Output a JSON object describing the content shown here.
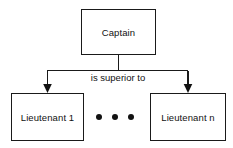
{
  "diagram": {
    "type": "hierarchy-tree",
    "canvas": {
      "width": 233,
      "height": 148,
      "background": "#ffffff"
    },
    "line_color": "#1a1a1a",
    "text_color": "#111111",
    "nodes": [
      {
        "id": "captain",
        "label": "Captain",
        "role": "root"
      },
      {
        "id": "lieutenant_1",
        "label": "Lieutenant 1",
        "role": "child"
      },
      {
        "id": "lieutenant_n",
        "label": "Lieutenant n",
        "role": "child"
      }
    ],
    "edges": [
      {
        "from": "captain",
        "to": "lieutenant_1",
        "label": "is superior to",
        "arrow": "filled-triangle"
      },
      {
        "from": "captain",
        "to": "lieutenant_n",
        "label": "is superior to",
        "arrow": "filled-triangle"
      }
    ],
    "edge_label": "is superior to",
    "ellipsis": {
      "glyph": "•••",
      "dot_count": 3,
      "meaning": "additional lieutenants omitted"
    }
  }
}
